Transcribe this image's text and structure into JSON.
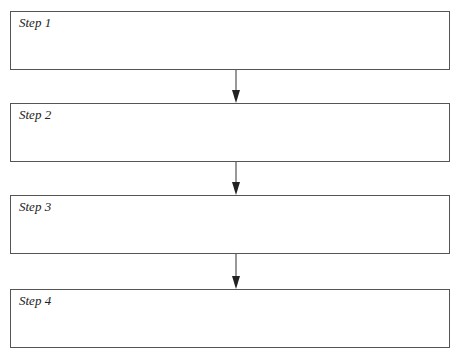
{
  "diagram": {
    "type": "flowchart",
    "direction": "top-to-bottom",
    "steps": [
      {
        "label": "Step 1"
      },
      {
        "label": "Step 2"
      },
      {
        "label": "Step 3"
      },
      {
        "label": "Step 4"
      }
    ],
    "connectors": [
      {
        "from": "Step 1",
        "to": "Step 2"
      },
      {
        "from": "Step 2",
        "to": "Step 3"
      },
      {
        "from": "Step 3",
        "to": "Step 4"
      }
    ]
  }
}
